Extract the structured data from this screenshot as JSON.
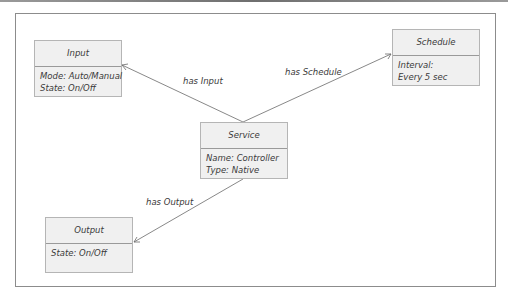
{
  "diagram": {
    "type": "class-relationship",
    "nodes": {
      "input": {
        "title": "Input",
        "attributes": [
          "Mode: Auto/Manual",
          "State: On/Off"
        ]
      },
      "schedule": {
        "title": "Schedule",
        "attributes": [
          "Interval:",
          "Every 5 sec"
        ]
      },
      "service": {
        "title": "Service",
        "attributes": [
          "Name: Controller",
          "Type: Native"
        ]
      },
      "output": {
        "title": "Output",
        "attributes": [
          "State: On/Off"
        ]
      }
    },
    "edges": {
      "has_input": {
        "from": "Service",
        "to": "Input",
        "label": "has Input"
      },
      "has_schedule": {
        "from": "Service",
        "to": "Schedule",
        "label": "has Schedule"
      },
      "has_output": {
        "from": "Service",
        "to": "Output",
        "label": "has Output"
      }
    },
    "colors": {
      "box_fill": "#f0f0f0",
      "box_border": "#b5b5b5",
      "line": "#6a6a6a",
      "text": "#3a3a3a"
    }
  }
}
